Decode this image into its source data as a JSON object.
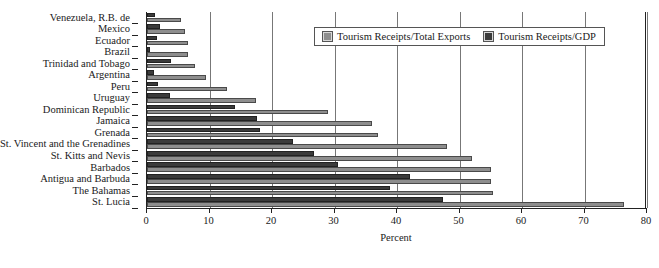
{
  "chart_data": {
    "type": "bar",
    "orientation": "horizontal",
    "title": "",
    "xlabel": "Percent",
    "ylabel": "",
    "xlim": [
      0,
      80
    ],
    "xticks": [
      0,
      10,
      20,
      30,
      40,
      50,
      60,
      70,
      80
    ],
    "grid": true,
    "legend_position": "top-right",
    "categories": [
      "Venezuela, R.B. de",
      "Mexico",
      "Ecuador",
      "Brazil",
      "Trinidad and Tobago",
      "Argentina",
      "Peru",
      "Uruguay",
      "Dominican Republic",
      "Jamaica",
      "Grenada",
      "St. Vincent and the Grenadines",
      "St. Kitts and Nevis",
      "Barbados",
      "Antigua and Barbuda",
      "The Bahamas",
      "St. Lucia"
    ],
    "series": [
      {
        "name": "Tourism Receipts/Total Exports",
        "color": "#8e8e8e",
        "values": [
          5.4,
          6.0,
          6.5,
          6.6,
          7.7,
          9.4,
          12.8,
          17.4,
          29.0,
          36.0,
          37.0,
          48.0,
          52.0,
          55.0,
          55.0,
          55.3,
          76.3
        ]
      },
      {
        "name": "Tourism Receipts/GDP",
        "color": "#3b3b3b",
        "values": [
          1.3,
          2.0,
          1.6,
          0.5,
          3.8,
          1.1,
          1.8,
          3.6,
          14.0,
          17.6,
          18.0,
          23.4,
          26.7,
          30.5,
          42.0,
          38.8,
          47.4
        ]
      }
    ]
  },
  "legend": {
    "items": [
      {
        "label": "Tourism Receipts/Total Exports",
        "swatch": "exports"
      },
      {
        "label": "Tourism Receipts/GDP",
        "swatch": "gdp"
      }
    ]
  }
}
